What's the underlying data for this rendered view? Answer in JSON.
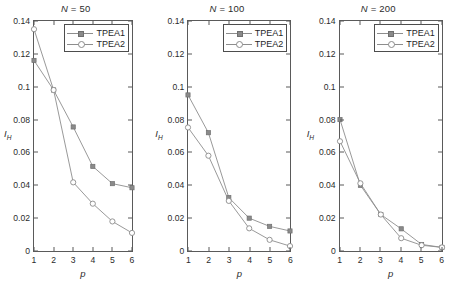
{
  "figure": {
    "panel_count": 3,
    "line_color": "#8d8d8d",
    "marker1_color": "#8a8a8a",
    "marker2_color": "#8a8a8a",
    "axis_color": "#5a5a5a"
  },
  "legend": {
    "entries": [
      {
        "label": "TPEA1",
        "marker": "filled-square"
      },
      {
        "label": "TPEA2",
        "marker": "open-circle"
      }
    ]
  },
  "axes": {
    "xlabel": "p",
    "ylabel_main": "I",
    "ylabel_sub": "H",
    "xticks": [
      "1",
      "2",
      "3",
      "4",
      "5",
      "6"
    ],
    "yticks": [
      "0",
      "0.02",
      "0.04",
      "0.06",
      "0.08",
      "0.1",
      "0.12",
      "0.14"
    ],
    "xlim": [
      1,
      6
    ],
    "ylim": [
      0,
      0.14
    ]
  },
  "chart_data": [
    {
      "type": "line",
      "title": "N = 50",
      "title_var": "N",
      "title_value": "50",
      "xlabel": "p",
      "ylabel": "I_H",
      "x": [
        1,
        2,
        3,
        4,
        5,
        6
      ],
      "xlim": [
        1,
        6
      ],
      "ylim": [
        0,
        0.14
      ],
      "grid": false,
      "legend_position": "top-right",
      "series": [
        {
          "name": "TPEA1",
          "marker": "filled-square",
          "values": [
            0.116,
            0.098,
            0.0755,
            0.0515,
            0.041,
            0.0385
          ]
        },
        {
          "name": "TPEA2",
          "marker": "open-circle",
          "values": [
            0.135,
            0.098,
            0.0418,
            0.0288,
            0.018,
            0.011
          ]
        }
      ]
    },
    {
      "type": "line",
      "title": "N = 100",
      "title_var": "N",
      "title_value": "100",
      "xlabel": "p",
      "ylabel": "I_H",
      "x": [
        1,
        2,
        3,
        4,
        5,
        6
      ],
      "xlim": [
        1,
        6
      ],
      "ylim": [
        0,
        0.14
      ],
      "grid": false,
      "legend_position": "top-right",
      "series": [
        {
          "name": "TPEA1",
          "marker": "filled-square",
          "values": [
            0.095,
            0.072,
            0.0325,
            0.02,
            0.015,
            0.0122
          ]
        },
        {
          "name": "TPEA2",
          "marker": "open-circle",
          "values": [
            0.0752,
            0.058,
            0.0305,
            0.0138,
            0.0068,
            0.003
          ]
        }
      ]
    },
    {
      "type": "line",
      "title": "N = 200",
      "title_var": "N",
      "title_value": "200",
      "xlabel": "p",
      "ylabel": "I_H",
      "x": [
        1,
        2,
        3,
        4,
        5,
        6
      ],
      "xlim": [
        1,
        6
      ],
      "ylim": [
        0,
        0.14
      ],
      "grid": false,
      "legend_position": "top-right",
      "series": [
        {
          "name": "TPEA1",
          "marker": "filled-square",
          "values": [
            0.08,
            0.04,
            0.0222,
            0.0135,
            0.004,
            0.0022
          ]
        },
        {
          "name": "TPEA2",
          "marker": "open-circle",
          "values": [
            0.0668,
            0.0412,
            0.0222,
            0.0078,
            0.0035,
            0.0022
          ]
        }
      ]
    }
  ]
}
